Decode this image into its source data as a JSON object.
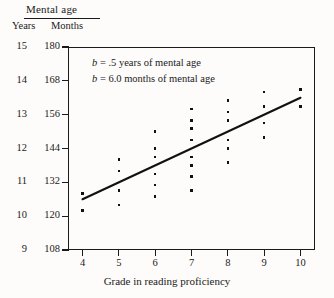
{
  "header": {
    "title": "Mental age",
    "col_years": "Years",
    "col_months": "Months"
  },
  "annotations": {
    "line1_prefix": "b",
    "line1_text": " =  .5 years of mental age",
    "line2_prefix": "b",
    "line2_text": " =  6.0 months of mental age"
  },
  "chart_data": {
    "type": "scatter",
    "title": "Mental age",
    "xlabel": "Grade in reading proficiency",
    "ylabel": "Mental age",
    "ylabel_primary": "Months",
    "ylabel_secondary": "Years",
    "grid": false,
    "legend": null,
    "xlim": [
      3.6,
      10.4
    ],
    "ylim": [
      108,
      180
    ],
    "xticks": [
      4,
      5,
      6,
      7,
      8,
      9,
      10
    ],
    "xtick_labels": [
      "4",
      "5",
      "6",
      "7",
      "8",
      "9",
      "10"
    ],
    "yticks_months": [
      180,
      168,
      156,
      144,
      132,
      120,
      108
    ],
    "ytick_labels_months": [
      "180",
      "168",
      "156",
      "144",
      "132",
      "120",
      "108"
    ],
    "yticks_years": [
      15,
      14,
      13,
      12,
      11,
      10,
      9
    ],
    "ytick_labels_years": [
      "15",
      "14",
      "13",
      "12",
      "11",
      "10",
      "9"
    ],
    "point_color": "#111111",
    "line_color": "#111111",
    "points": [
      {
        "x": 4,
        "y": 128
      },
      {
        "x": 4,
        "y": 122
      },
      {
        "x": 5,
        "y": 140
      },
      {
        "x": 5,
        "y": 136
      },
      {
        "x": 5,
        "y": 129
      },
      {
        "x": 5,
        "y": 124
      },
      {
        "x": 6,
        "y": 150
      },
      {
        "x": 6,
        "y": 144
      },
      {
        "x": 6,
        "y": 141
      },
      {
        "x": 6,
        "y": 135
      },
      {
        "x": 6,
        "y": 131
      },
      {
        "x": 6,
        "y": 127
      },
      {
        "x": 7,
        "y": 158
      },
      {
        "x": 7,
        "y": 154
      },
      {
        "x": 7,
        "y": 151
      },
      {
        "x": 7,
        "y": 147
      },
      {
        "x": 7,
        "y": 141
      },
      {
        "x": 7,
        "y": 138
      },
      {
        "x": 7,
        "y": 134
      },
      {
        "x": 7,
        "y": 129
      },
      {
        "x": 8,
        "y": 161
      },
      {
        "x": 8,
        "y": 157
      },
      {
        "x": 8,
        "y": 154
      },
      {
        "x": 8,
        "y": 147
      },
      {
        "x": 8,
        "y": 144
      },
      {
        "x": 8,
        "y": 139
      },
      {
        "x": 9,
        "y": 164
      },
      {
        "x": 9,
        "y": 159
      },
      {
        "x": 9,
        "y": 153
      },
      {
        "x": 9,
        "y": 148
      },
      {
        "x": 10,
        "y": 165
      },
      {
        "x": 10,
        "y": 159
      }
    ],
    "regression_line": {
      "slope_months_per_grade": 6.0,
      "slope_years_per_grade": 0.5,
      "x_start": 4,
      "y_start": 126,
      "x_end": 10,
      "y_end": 162
    }
  }
}
